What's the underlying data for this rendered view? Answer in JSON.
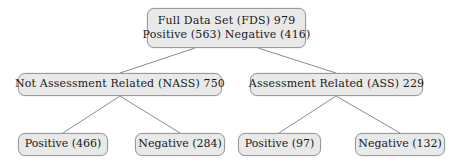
{
  "diagram": {
    "type": "tree",
    "colors": {
      "node_fill": "#e9e9e9",
      "node_border": "#9a9a9a",
      "edge": "#8c8c8c",
      "text": "#1a1a1a",
      "background": "#ffffff"
    },
    "nodes": {
      "root": {
        "id": "full-data-set",
        "line1": "Full Data Set (FDS) 979",
        "line2": "Positive (563) Negative (416)",
        "label": "Full Data Set (FDS) 979 Positive (563) Negative (416)",
        "total": 979,
        "positive": 563,
        "negative": 416
      },
      "nass": {
        "id": "not-assessment-related",
        "line1": "Not Assessment Related (NASS) 750",
        "total": 750
      },
      "ass": {
        "id": "assessment-related",
        "line1": "Assessment Related (ASS) 229",
        "total": 229
      },
      "nass_positive": {
        "id": "nass-positive",
        "line1": "Positive (466)",
        "count": 466
      },
      "nass_negative": {
        "id": "nass-negative",
        "line1": "Negative (284)",
        "count": 284
      },
      "ass_positive": {
        "id": "ass-positive",
        "line1": "Positive (97)",
        "count": 97
      },
      "ass_negative": {
        "id": "ass-negative",
        "line1": "Negative (132)",
        "count": 132
      }
    },
    "edges": [
      {
        "from": "full-data-set",
        "to": "not-assessment-related"
      },
      {
        "from": "full-data-set",
        "to": "assessment-related"
      },
      {
        "from": "not-assessment-related",
        "to": "nass-positive"
      },
      {
        "from": "not-assessment-related",
        "to": "nass-negative"
      },
      {
        "from": "assessment-related",
        "to": "ass-positive"
      },
      {
        "from": "assessment-related",
        "to": "ass-negative"
      }
    ]
  }
}
